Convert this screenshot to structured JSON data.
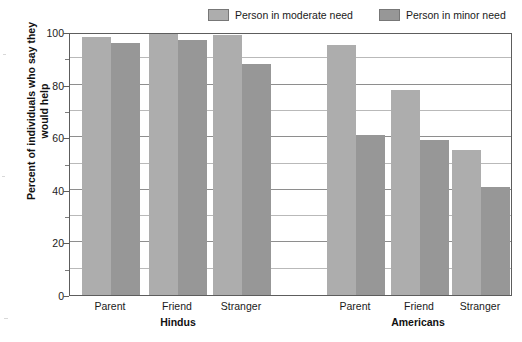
{
  "chart_data": {
    "type": "bar",
    "title": "",
    "subtitle": "",
    "xlabel": "",
    "ylabel": "Percent of individuals who say they would help",
    "ylim": [
      0,
      100
    ],
    "ytick_labels": [
      "0",
      "20",
      "40",
      "60",
      "80",
      "100"
    ],
    "ytick_values": [
      0,
      20,
      40,
      60,
      80,
      100
    ],
    "minor_gridlines": [
      10,
      30,
      50,
      70,
      90
    ],
    "grid": true,
    "legend_position": "top-right",
    "groups": [
      "Hindus",
      "Americans"
    ],
    "categories": [
      "Parent",
      "Friend",
      "Stranger",
      "Parent",
      "Friend",
      "Stranger"
    ],
    "category_groups": [
      "Hindus",
      "Hindus",
      "Hindus",
      "Americans",
      "Americans",
      "Americans"
    ],
    "series": [
      {
        "name": "Person in moderate need",
        "color": "#adadad",
        "values": [
          98,
          100,
          99,
          95,
          78,
          55
        ]
      },
      {
        "name": "Person in minor need",
        "color": "#979797",
        "values": [
          96,
          97,
          88,
          61,
          59,
          41
        ]
      }
    ]
  },
  "legend": {
    "items": [
      {
        "label": "Person in moderate need",
        "color": "#adadad"
      },
      {
        "label": "Person in minor need",
        "color": "#979797"
      }
    ]
  },
  "axes": {
    "y_title": "Percent of individuals who say they would help",
    "y_ticks": [
      {
        "label": "100",
        "value": 100
      },
      {
        "label": "80",
        "value": 80
      },
      {
        "label": "60",
        "value": 60
      },
      {
        "label": "40",
        "value": 40
      },
      {
        "label": "20",
        "value": 20
      },
      {
        "label": "0",
        "value": 0
      }
    ],
    "x_categories": [
      {
        "label": "Parent"
      },
      {
        "label": "Friend"
      },
      {
        "label": "Stranger"
      },
      {
        "label": "Parent"
      },
      {
        "label": "Friend"
      },
      {
        "label": "Stranger"
      }
    ],
    "x_groups": [
      {
        "label": "Hindus"
      },
      {
        "label": "Americans"
      }
    ]
  },
  "colors": {
    "moderate": "#adadad",
    "minor": "#979797",
    "frame": "#5d5d5d",
    "grid_major": "#8e8e8e",
    "grid_minor": "#b9b9b9",
    "text": "#1a1a1a",
    "background": "#ffffff"
  }
}
